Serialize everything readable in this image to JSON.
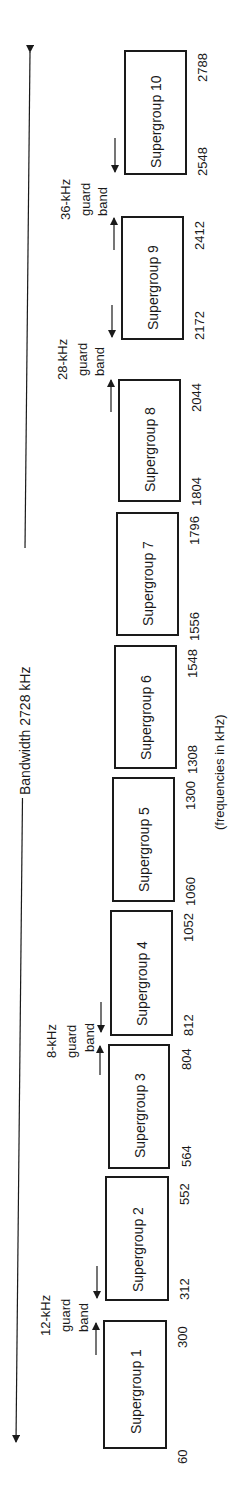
{
  "diagram": {
    "title": "Bandwidth 2728 kHz",
    "units_note": "(frequencies in kHz)",
    "supergroups": [
      {
        "label": "Supergroup 1",
        "start": "60",
        "end": "300"
      },
      {
        "label": "Supergroup 2",
        "start": "312",
        "end": "552"
      },
      {
        "label": "Supergroup 3",
        "start": "564",
        "end": "804"
      },
      {
        "label": "Supergroup 4",
        "start": "812",
        "end": "1052"
      },
      {
        "label": "Supergroup 5",
        "start": "1060",
        "end": "1300"
      },
      {
        "label": "Supergroup 6",
        "start": "1308",
        "end": "1548"
      },
      {
        "label": "Supergroup 7",
        "start": "1556",
        "end": "1796"
      },
      {
        "label": "Supergroup 8",
        "start": "1804",
        "end": "2044"
      },
      {
        "label": "Supergroup 9",
        "start": "2172",
        "end": "2412"
      },
      {
        "label": "Supergroup 10",
        "start": "2548",
        "end": "2788"
      }
    ],
    "guard_bands": [
      {
        "line1": "12-kHz",
        "line2": "guard",
        "line3": "band"
      },
      {
        "line1": "8-kHz",
        "line2": "guard",
        "line3": "band"
      },
      {
        "line1": "28-kHz",
        "line2": "guard",
        "line3": "band"
      },
      {
        "line1": "36-kHz",
        "line2": "guard",
        "line3": "band"
      }
    ]
  }
}
